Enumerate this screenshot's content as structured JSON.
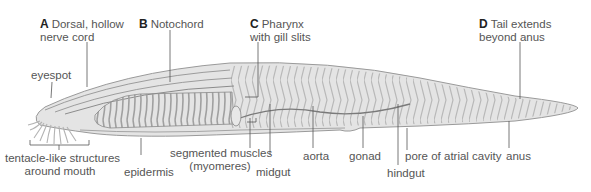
{
  "figure": {
    "colors": {
      "body": "#e2e2e2",
      "outline": "#9a9a9a",
      "leader": "#555555",
      "text": "#555555",
      "letter": "#222222"
    },
    "labels_top": [
      {
        "letter": "A",
        "line1": "Dorsal, hollow",
        "line2": "nerve cord"
      },
      {
        "letter": "B",
        "line1": "Notochord"
      },
      {
        "letter": "C",
        "line1": "Pharynx",
        "line2": "with gill slits"
      },
      {
        "letter": "D",
        "line1": "Tail extends",
        "line2": "beyond anus"
      }
    ],
    "labels_side": {
      "eyespot": "eyespot"
    },
    "labels_bottom": {
      "tentacles_line1": "tentacle-like structures",
      "tentacles_line2": "around mouth",
      "epidermis": "epidermis",
      "muscles_line1": "segmented muscles",
      "muscles_line2": "(myomeres)",
      "midgut": "midgut",
      "aorta": "aorta",
      "gonad": "gonad",
      "pore": "pore of atrial cavity",
      "hindgut": "hindgut",
      "anus": "anus"
    }
  }
}
